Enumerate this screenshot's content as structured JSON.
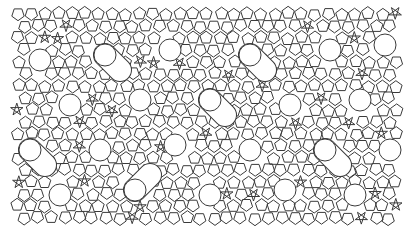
{
  "figure": {
    "kind": "aperiodic-tiling",
    "colors": {
      "background": "#ffffff",
      "stroke": "#3a3a3a"
    },
    "bounds": {
      "x0": 18,
      "y0": 14,
      "x1": 402,
      "y1": 222
    },
    "circle_radius": 11,
    "pentagon_size": 6.5,
    "circles": [
      [
        40,
        60
      ],
      [
        105,
        55
      ],
      [
        170,
        50
      ],
      [
        250,
        55
      ],
      [
        330,
        50
      ],
      [
        385,
        45
      ],
      [
        70,
        105
      ],
      [
        140,
        100
      ],
      [
        210,
        100
      ],
      [
        290,
        105
      ],
      [
        360,
        100
      ],
      [
        30,
        150
      ],
      [
        100,
        150
      ],
      [
        175,
        145
      ],
      [
        250,
        150
      ],
      [
        325,
        150
      ],
      [
        390,
        150
      ],
      [
        60,
        195
      ],
      [
        135,
        190
      ],
      [
        210,
        195
      ],
      [
        285,
        190
      ],
      [
        355,
        195
      ]
    ],
    "merged_pairs": [
      [
        [
          105,
          55
        ],
        [
          120,
          70
        ]
      ],
      [
        [
          250,
          55
        ],
        [
          265,
          70
        ]
      ],
      [
        [
          210,
          100
        ],
        [
          225,
          115
        ]
      ],
      [
        [
          325,
          150
        ],
        [
          340,
          165
        ]
      ],
      [
        [
          135,
          190
        ],
        [
          150,
          175
        ]
      ],
      [
        [
          30,
          150
        ],
        [
          45,
          165
        ]
      ]
    ]
  }
}
